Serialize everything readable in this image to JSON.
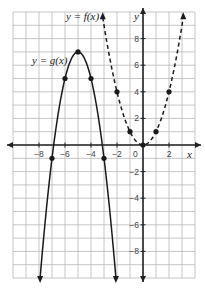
{
  "chart_data": {
    "type": "line",
    "title": "",
    "xlabel": "x",
    "ylabel": "y",
    "xlim": [
      -10,
      4
    ],
    "ylim": [
      -10,
      10
    ],
    "grid": true,
    "x_ticks": [
      -8,
      -6,
      -4,
      -2,
      0,
      2
    ],
    "y_ticks": [
      -8,
      -6,
      -4,
      -2,
      2,
      4,
      6,
      8
    ],
    "series": [
      {
        "name": "y = f(x)",
        "style": "dashed",
        "equation": "f(x) = x^2",
        "points": [
          [
            -2,
            4
          ],
          [
            -1,
            1
          ],
          [
            0,
            0
          ],
          [
            1,
            1
          ],
          [
            2,
            4
          ]
        ]
      },
      {
        "name": "y = g(x)",
        "style": "solid",
        "equation": "g(x) = -2(x+5)^2 + 7",
        "points": [
          [
            -7,
            -1
          ],
          [
            -6,
            5
          ],
          [
            -5,
            7
          ],
          [
            -4,
            5
          ],
          [
            -3,
            -1
          ]
        ]
      }
    ],
    "annotations": [
      "y = f(x)",
      "y = g(x)"
    ]
  },
  "labels": {
    "f": "y = f(x)",
    "g": "y = g(x)",
    "x_axis": "x",
    "y_axis": "y",
    "origin": "0"
  },
  "colors": {
    "grid": "#b8b8b8",
    "axis": "#222222",
    "curve": "#1a1a1a",
    "background": "#ffffff"
  }
}
